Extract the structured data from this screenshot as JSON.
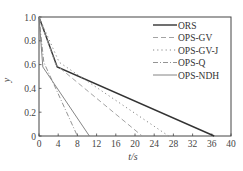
{
  "chart_data": {
    "type": "line",
    "title": "",
    "xlabel": "t/s",
    "ylabel": "y",
    "xlim": [
      0,
      40
    ],
    "ylim": [
      0,
      1.0
    ],
    "xticks": [
      0,
      4,
      8,
      12,
      16,
      20,
      24,
      28,
      32,
      36,
      40
    ],
    "yticks": [
      0,
      0.2,
      0.4,
      0.6,
      0.8,
      1.0
    ],
    "ytick_labels": [
      "0",
      "0.2",
      "0.4",
      "0.6",
      "0.8",
      "1.0"
    ],
    "grid": false,
    "legend_position": "upper right",
    "series": [
      {
        "name": "ORS",
        "style": "solid-thick",
        "color": "#333333",
        "x": [
          0,
          3.8,
          36.5
        ],
        "y": [
          1.0,
          0.58,
          0
        ]
      },
      {
        "name": "OPS-GV",
        "style": "dashed",
        "color": "#999999",
        "x": [
          0,
          3.5,
          21.5
        ],
        "y": [
          1.0,
          0.6,
          0
        ]
      },
      {
        "name": "OPS-GV-J",
        "style": "dotted",
        "color": "#888888",
        "x": [
          0,
          4.2,
          27.0
        ],
        "y": [
          1.0,
          0.62,
          0
        ]
      },
      {
        "name": "OPS-Q",
        "style": "dashdot",
        "color": "#888888",
        "x": [
          0,
          1.0,
          8.0
        ],
        "y": [
          1.0,
          0.62,
          0
        ]
      },
      {
        "name": "OPS-NDH",
        "style": "solid-thin",
        "color": "#777777",
        "x": [
          0,
          0.8,
          10.5
        ],
        "y": [
          1.0,
          0.58,
          0
        ]
      }
    ]
  },
  "legend": {
    "items": [
      "ORS",
      "OPS-GV",
      "OPS-GV-J",
      "OPS-Q",
      "OPS-NDH"
    ]
  }
}
